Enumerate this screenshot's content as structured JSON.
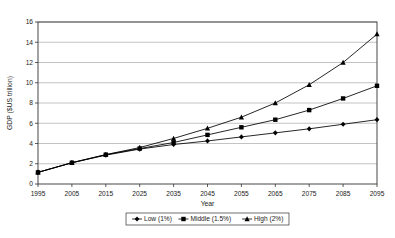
{
  "chart_data": {
    "type": "line",
    "title": "",
    "xlabel": "Year",
    "ylabel": "GDP ($US trillion)",
    "x": [
      1995,
      2005,
      2015,
      2025,
      2035,
      2045,
      2055,
      2065,
      2075,
      2085,
      2095
    ],
    "categories": [
      "1995",
      "2005",
      "2015",
      "2025",
      "2035",
      "2045",
      "2055",
      "2065",
      "2075",
      "2085",
      "2095"
    ],
    "xlim": [
      1995,
      2095
    ],
    "ylim": [
      0,
      16
    ],
    "ytick_step": 2,
    "yticks": [
      "0",
      "2",
      "4",
      "6",
      "8",
      "10",
      "12",
      "14",
      "16"
    ],
    "grid": "horizontal",
    "legend_position": "bottom",
    "series": [
      {
        "name": "Low (1%)",
        "marker": "diamond",
        "color": "#000000",
        "values": [
          1.15,
          2.1,
          2.85,
          3.45,
          3.9,
          4.25,
          4.65,
          5.05,
          5.45,
          5.9,
          6.35
        ]
      },
      {
        "name": "Middle (1.5%)",
        "marker": "square",
        "color": "#000000",
        "values": [
          1.15,
          2.1,
          2.9,
          3.5,
          4.1,
          4.85,
          5.6,
          6.35,
          7.3,
          8.45,
          9.7
        ]
      },
      {
        "name": "High (2%)",
        "marker": "triangle",
        "color": "#000000",
        "values": [
          1.15,
          2.1,
          2.9,
          3.6,
          4.5,
          5.5,
          6.6,
          8.0,
          9.8,
          12.0,
          14.8
        ]
      }
    ]
  },
  "legend": {
    "items": [
      {
        "label": "Low (1%)",
        "marker": "diamond"
      },
      {
        "label": "Middle (1.5%)",
        "marker": "square"
      },
      {
        "label": "High (2%)",
        "marker": "triangle"
      }
    ]
  }
}
